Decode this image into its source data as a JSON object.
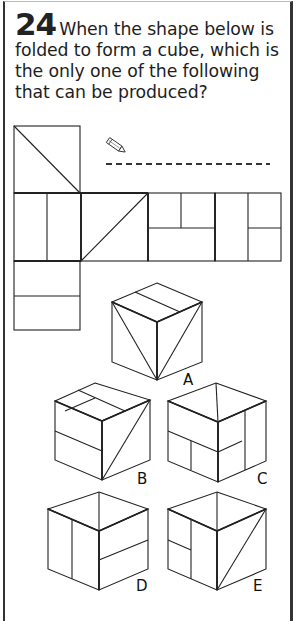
{
  "question": {
    "number": "24",
    "text": "When the shape below is folded to form a cube, which is the only one of the following that can be produced?"
  },
  "answer_area": {
    "icon": "pencil-icon",
    "line_style": "dashed"
  },
  "net": {
    "description": "cube net: one square above the first square of a row of four, one square below the first square",
    "faces": [
      {
        "id": "top",
        "pattern": "diagonal top-left to bottom-right"
      },
      {
        "id": "row1",
        "pattern": "vertical split into two halves"
      },
      {
        "id": "row2",
        "pattern": "diagonal bottom-left to top-right"
      },
      {
        "id": "row3",
        "pattern": "horizontal split, top half split vertically"
      },
      {
        "id": "row4",
        "pattern": "vertical split; right half split horizontally"
      },
      {
        "id": "bottom",
        "pattern": "horizontal split into two halves"
      }
    ]
  },
  "options": [
    {
      "label": "A"
    },
    {
      "label": "B"
    },
    {
      "label": "C"
    },
    {
      "label": "D"
    },
    {
      "label": "E"
    }
  ],
  "colors": {
    "line": "#222222",
    "border": "#333333",
    "text": "#1e1e1e",
    "background": "#ffffff"
  }
}
